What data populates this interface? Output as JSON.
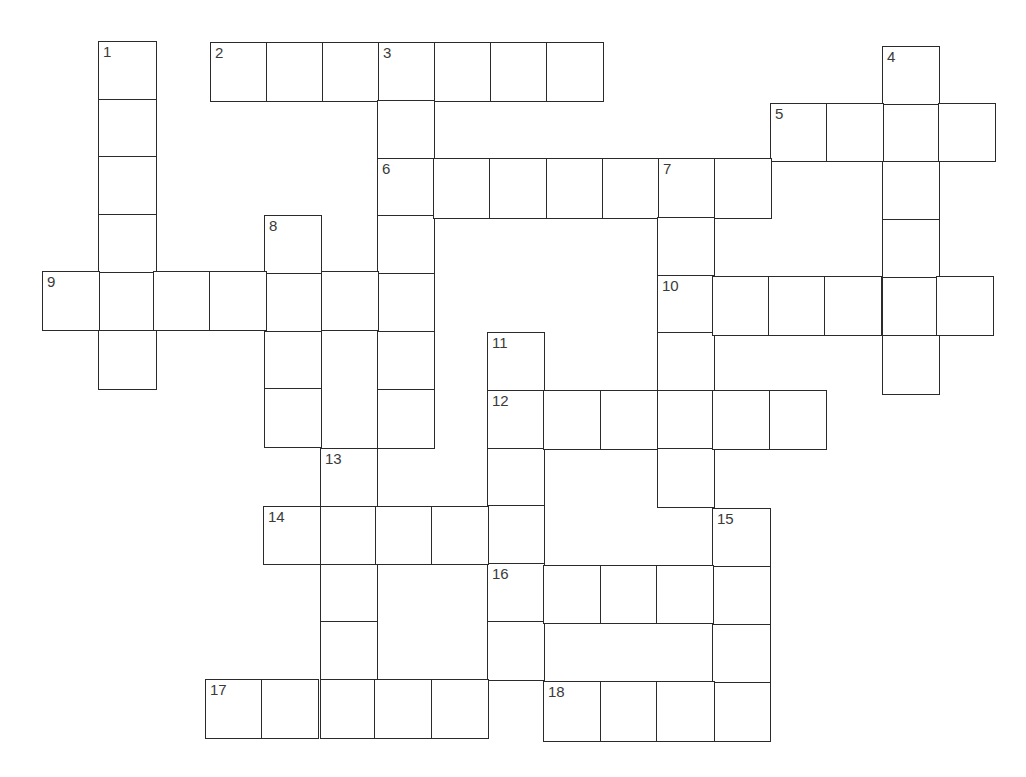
{
  "puzzle": {
    "type": "crossword",
    "line_color": "#2b2b2b",
    "number_color": "#3a3a3a",
    "background": "#ffffff"
  },
  "entries": [
    {
      "number": "1",
      "direction": "down",
      "length": 6,
      "x": 98,
      "y": 41,
      "cw": 57,
      "ch": 57.7
    },
    {
      "number": "2",
      "direction": "across",
      "length": 7,
      "x": 210,
      "y": 42,
      "cw": 56,
      "ch": 58
    },
    {
      "number": "3",
      "direction": "down",
      "length": 7,
      "x": 377,
      "y": 42,
      "cw": 56,
      "ch": 57.8
    },
    {
      "number": "4",
      "direction": "down",
      "length": 6,
      "x": 882,
      "y": 46,
      "cw": 56,
      "ch": 57.7
    },
    {
      "number": "5",
      "direction": "across",
      "length": 4,
      "x": 770,
      "y": 103,
      "cw": 56,
      "ch": 57
    },
    {
      "number": "6",
      "direction": "across",
      "length": 7,
      "x": 377,
      "y": 158,
      "cw": 56.2,
      "ch": 59
    },
    {
      "number": "7",
      "direction": "down",
      "length": 6,
      "x": 657,
      "y": 159,
      "cw": 56,
      "ch": 57.8
    },
    {
      "number": "8",
      "direction": "down",
      "length": 4,
      "x": 264,
      "y": 215,
      "cw": 56,
      "ch": 57.8
    },
    {
      "number": "9",
      "direction": "across",
      "length": 7,
      "x": 42,
      "y": 271,
      "cw": 55.7,
      "ch": 58
    },
    {
      "number": "10",
      "direction": "across",
      "length": 6,
      "x": 656,
      "y": 276,
      "cw": 56,
      "ch": 58
    },
    {
      "number": "11",
      "direction": "down",
      "length": 6,
      "x": 487,
      "y": 332,
      "cw": 56,
      "ch": 57.8
    },
    {
      "number": "12",
      "direction": "across",
      "length": 6,
      "x": 487,
      "y": 390,
      "cw": 56.3,
      "ch": 58
    },
    {
      "number": "13",
      "direction": "down",
      "length": 5,
      "x": 320,
      "y": 448,
      "cw": 56,
      "ch": 57.8
    },
    {
      "number": "14",
      "direction": "across",
      "length": 5,
      "x": 263,
      "y": 506,
      "cw": 56,
      "ch": 57
    },
    {
      "number": "15",
      "direction": "down",
      "length": 4,
      "x": 712,
      "y": 508,
      "cw": 57,
      "ch": 58
    },
    {
      "number": "16",
      "direction": "across",
      "length": 5,
      "x": 487,
      "y": 565,
      "cw": 56.4,
      "ch": 57
    },
    {
      "number": "17",
      "direction": "across",
      "length": 5,
      "x": 205,
      "y": 679,
      "cw": 56.4,
      "ch": 58
    },
    {
      "number": "18",
      "direction": "across",
      "length": 4,
      "x": 543,
      "y": 681,
      "cw": 56.5,
      "ch": 59
    }
  ],
  "footer": {
    "cutoff_text": "· · ·"
  }
}
